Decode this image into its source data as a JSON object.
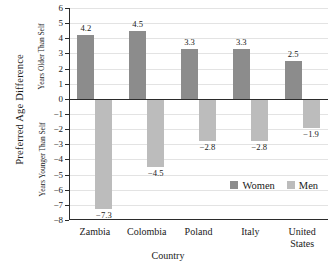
{
  "chart_data": {
    "type": "bar",
    "title": "",
    "xlabel": "Country",
    "ylabel": "Preferred Age Difference",
    "ylabel_upper": "Years Older Than Self",
    "ylabel_lower": "Years Younger Than Self",
    "categories": [
      "Zambia",
      "Colombia",
      "Poland",
      "Italy",
      "United\nStates"
    ],
    "series": [
      {
        "name": "Women",
        "color": "#8c8c8c",
        "values": [
          4.2,
          4.5,
          3.3,
          3.3,
          2.5
        ]
      },
      {
        "name": "Men",
        "color": "#bcbcbc",
        "values": [
          -7.3,
          -4.5,
          -2.8,
          -2.8,
          -1.9
        ]
      }
    ],
    "value_labels": {
      "women": [
        "4.2",
        "4.5",
        "3.3",
        "3.3",
        "2.5"
      ],
      "men": [
        "−7.3",
        "−4.5",
        "−2.8",
        "−2.8",
        "−1.9"
      ]
    },
    "ylim": [
      -8,
      6
    ],
    "yticks": [
      6,
      5,
      4,
      3,
      2,
      1,
      0,
      -1,
      -2,
      -3,
      -4,
      -5,
      -6,
      -7,
      -8
    ],
    "ytick_labels": [
      "6",
      "5",
      "4",
      "3",
      "2",
      "1",
      "0",
      "−1",
      "−2",
      "−3",
      "−4",
      "−5",
      "−6",
      "−7",
      "−8"
    ],
    "grid": true,
    "legend_position": "inside lower-right"
  },
  "legend": {
    "entries": [
      {
        "label": "Women",
        "swatch": "women"
      },
      {
        "label": "Men",
        "swatch": "men"
      }
    ]
  }
}
